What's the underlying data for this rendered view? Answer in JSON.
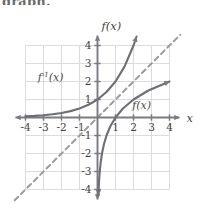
{
  "page": {
    "clipped_header_text": "graph."
  },
  "chart_data": {
    "type": "line",
    "title": "",
    "xlabel": "x",
    "ylabel": "f(x)",
    "xlim": [
      -4,
      4
    ],
    "ylim": [
      -4,
      4
    ],
    "grid": true,
    "legend": "inline-annotations",
    "x_ticks": [
      -4,
      -3,
      -2,
      -1,
      1,
      2,
      3,
      4
    ],
    "y_ticks": [
      -4,
      -3,
      -2,
      -1,
      1,
      2,
      3,
      4
    ],
    "x_tick_labels": [
      "-4",
      "-3",
      "-2",
      "-1",
      "1",
      "2",
      "3",
      "4"
    ],
    "y_tick_labels": [
      "-4",
      "-3",
      "-2",
      "-1",
      "1",
      "2",
      "3",
      "4"
    ],
    "series": [
      {
        "name": "f^-1(x)",
        "label": "f",
        "label_sup": "-1",
        "label_arg": "(x)",
        "style": "solid",
        "color": "#6e6e78",
        "equation": "y = 2^x",
        "x": [
          -4,
          -3.5,
          -3,
          -2.5,
          -2,
          -1.5,
          -1,
          -0.5,
          0,
          0.5,
          1,
          1.5,
          2,
          2.17
        ],
        "y": [
          0.0625,
          0.088,
          0.125,
          0.177,
          0.25,
          0.354,
          0.5,
          0.707,
          1,
          1.414,
          2,
          2.828,
          4,
          4.5
        ],
        "arrow_end": [
          2.17,
          4.5
        ],
        "asymptote": "y = 0",
        "label_position": [
          -2.6,
          2.05
        ]
      },
      {
        "name": "f(x)",
        "label": "f",
        "label_sup": "",
        "label_arg": "(x)",
        "style": "solid",
        "color": "#6e6e78",
        "equation": "y = log2(x)",
        "x": [
          0.0625,
          0.088,
          0.125,
          0.177,
          0.25,
          0.354,
          0.5,
          0.707,
          1,
          1.414,
          2,
          2.828,
          4
        ],
        "y": [
          -4,
          -3.5,
          -3,
          -2.5,
          -2,
          -1.5,
          -1,
          -0.5,
          0,
          0.5,
          1,
          1.5,
          2
        ],
        "arrow_end": [
          4,
          2
        ],
        "arrow_start": [
          0.055,
          -4.3
        ],
        "asymptote": "x = 0",
        "label_position": [
          2.45,
          0.45
        ]
      },
      {
        "name": "y = x",
        "label": "",
        "style": "dashed",
        "color": "#9a9aa2",
        "equation": "y = x",
        "x": [
          -4.6,
          4.6
        ],
        "y": [
          -4.6,
          4.6
        ]
      }
    ],
    "colors": {
      "axis": "#7a7a82",
      "grid": "#d8d8dc",
      "curve": "#6e6e78",
      "identity_line": "#9a9aa2",
      "text": "#3f3f3f",
      "background": "#ffffff"
    }
  }
}
